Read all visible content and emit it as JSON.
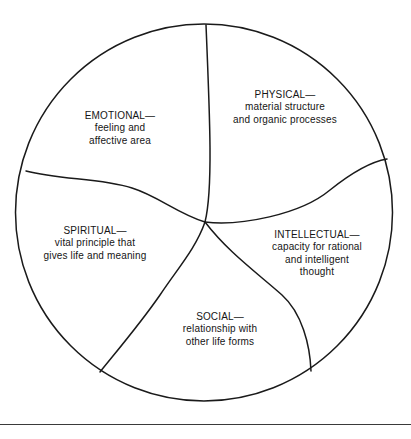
{
  "figure": {
    "type": "pinwheel-circle-diagram",
    "shape": "circle divided into five spiral wedge segments",
    "stroke_color": "#1a1a1a",
    "background_color": "#ffffff",
    "rule_color": "#3a3a3a"
  },
  "segments": [
    {
      "id": "physical",
      "title": "PHYSICAL—",
      "lines": [
        "material structure",
        "and organic processes"
      ]
    },
    {
      "id": "emotional",
      "title": "EMOTIONAL—",
      "lines": [
        "feeling and",
        "affective area"
      ]
    },
    {
      "id": "spiritual",
      "title": "SPIRITUAL—",
      "lines": [
        "vital principle that",
        "gives life and meaning"
      ]
    },
    {
      "id": "social",
      "title": "SOCIAL—",
      "lines": [
        "relationship with",
        "other life forms"
      ]
    },
    {
      "id": "intellectual",
      "title": "INTELLECTUAL—",
      "lines": [
        "capacity for rational",
        "and intelligent",
        "thought"
      ]
    }
  ]
}
